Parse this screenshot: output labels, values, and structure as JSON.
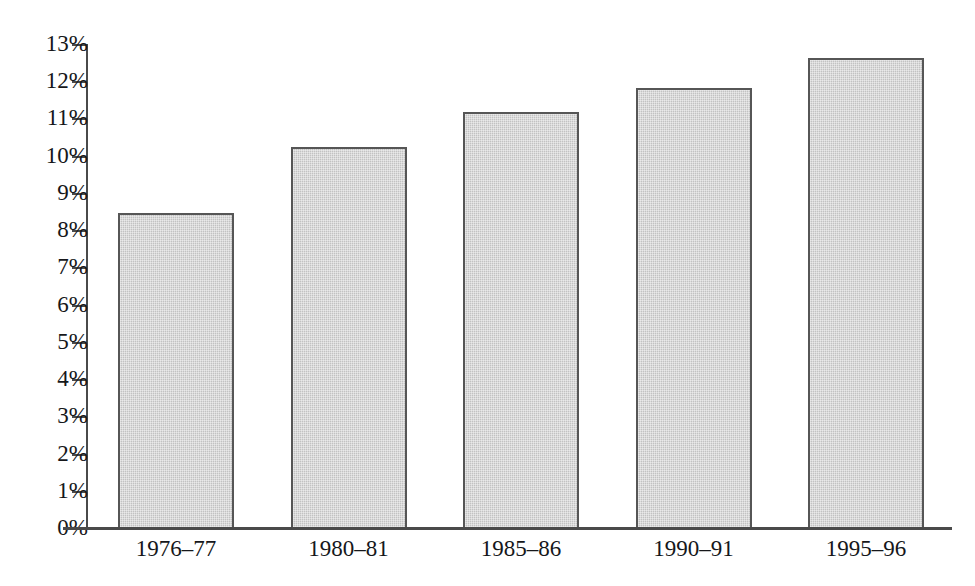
{
  "chart_data": {
    "type": "bar",
    "title": "",
    "subtitle": "",
    "xlabel": "",
    "ylabel": "",
    "categories": [
      "1976–77",
      "1980–81",
      "1985–86",
      "1990–91",
      "1995–96"
    ],
    "values": [
      8.5,
      10.25,
      11.2,
      11.85,
      12.65
    ],
    "value_labels": [
      "",
      "",
      "",
      "",
      ""
    ],
    "ylim": [
      0,
      13
    ],
    "ytick_step": 1,
    "ytick_labels": [
      "0%",
      "1%",
      "2%",
      "3%",
      "4%",
      "5%",
      "6%",
      "7%",
      "8%",
      "9%",
      "10%",
      "11%",
      "12%",
      "13%"
    ],
    "ytick_values": [
      0,
      1,
      2,
      3,
      4,
      5,
      6,
      7,
      8,
      9,
      10,
      11,
      12,
      13
    ],
    "grid": false,
    "legend": false,
    "legend_position": "none",
    "annotations": [],
    "series": [
      {
        "name": "",
        "values": [
          8.5,
          10.25,
          11.2,
          11.85,
          12.65
        ]
      }
    ],
    "colors": {
      "bar_fill": "#c9c9c9",
      "bar_border": "#565656",
      "axis": "#4a4a4a",
      "text": "#16171a",
      "background": "#ffffff"
    }
  }
}
